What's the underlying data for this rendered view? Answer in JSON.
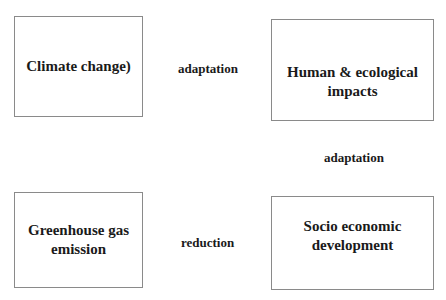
{
  "diagram": {
    "boxes": [
      {
        "id": "climate-change",
        "lines": [
          "Climate change)"
        ]
      },
      {
        "id": "human-ecological-impacts",
        "lines": [
          "Human & ecological",
          "impacts"
        ]
      },
      {
        "id": "greenhouse-gas-emission",
        "lines": [
          "Greenhouse gas",
          "emission"
        ]
      },
      {
        "id": "socio-economic-development",
        "lines": [
          "Socio economic",
          "development"
        ]
      }
    ],
    "labels": {
      "top_middle": "adaptation",
      "right_middle": "adaptation",
      "bottom_middle": "reduction"
    }
  }
}
